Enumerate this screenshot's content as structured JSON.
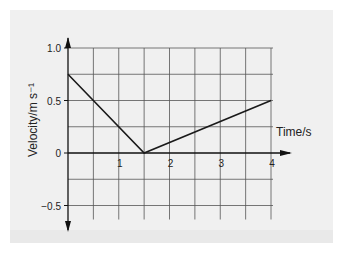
{
  "chart_data": {
    "type": "line",
    "title": "",
    "xlabel": "Time/s",
    "ylabel": "Velocity/m s⁻¹",
    "xlim": [
      0,
      4
    ],
    "ylim": [
      -0.5,
      1.0
    ],
    "grid": true,
    "legend": null,
    "x_ticks": [
      1,
      2,
      3,
      4
    ],
    "x_tick_labels": [
      "1",
      "2",
      "3",
      "4"
    ],
    "y_ticks": [
      1.0,
      0.5,
      0,
      -0.5
    ],
    "y_tick_labels": [
      "1.0",
      "0.5",
      "0",
      "−0.5"
    ],
    "x_grid_step": 0.5,
    "y_grid_step": 0.25,
    "series": [
      {
        "name": "velocity",
        "x": [
          0,
          1.5,
          4
        ],
        "y": [
          0.75,
          0,
          0.5
        ],
        "color": "#1a1a1a"
      }
    ]
  },
  "colors": {
    "panel": "#f0f0f0",
    "grid": "#555555",
    "axis": "#111111"
  }
}
